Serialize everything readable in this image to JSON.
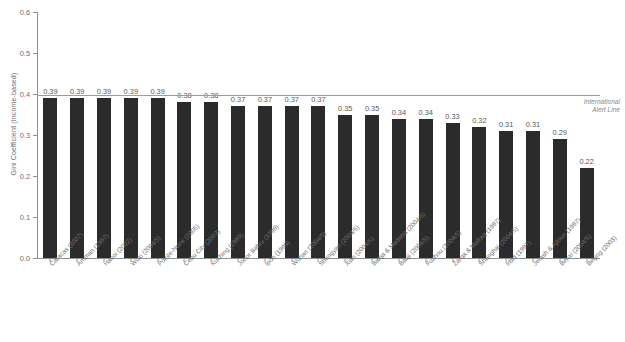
{
  "chart_data": {
    "type": "bar",
    "title": "",
    "subtitle": "",
    "xlabel": "",
    "ylabel": "Gini Coefficient (Income-based)",
    "ylim": [
      0.0,
      0.6
    ],
    "yticks": [
      "0.0",
      "0.1",
      "0.2",
      "0.3",
      "0.4",
      "0.5",
      "0.6"
    ],
    "ytick_values": [
      0.0,
      0.1,
      0.2,
      0.3,
      0.4,
      0.5,
      0.6
    ],
    "grid": false,
    "legend": "none",
    "orientation": "vertical",
    "bar_color": "#2b2b2b",
    "categories": [
      "Caracas (2007)",
      "Amman (1997)",
      "Hanoi (2002)",
      "Wuxi (2004/5)",
      "Pointe-Noire (2005)",
      "Cebu City (2003)",
      "Kuching (1999)",
      "Johor Bahru (1999)",
      "Ipoh (1999)",
      "Wuhan (2004/5)",
      "Shengyan (2004/5)",
      "Xian (2004/5)",
      "Balqa & Madaba (2004/5)",
      "Baoji (2004/5)",
      "Fuzhou (2004/5)",
      "Zarqa & Mafraq (1997)",
      "Shanghai (2004/5)",
      "Irbid (1997)",
      "Jerash & Ajloun (1997)",
      "Benxi (2004/5)",
      "Beijing (2003)"
    ],
    "values": [
      0.39,
      0.39,
      0.39,
      0.39,
      0.39,
      0.38,
      0.38,
      0.37,
      0.37,
      0.37,
      0.37,
      0.35,
      0.35,
      0.34,
      0.34,
      0.33,
      0.32,
      0.31,
      0.31,
      0.29,
      0.22
    ],
    "value_labels": [
      "0.39",
      "0.39",
      "0.39",
      "0.39",
      "0.39",
      "0.38",
      "0.38",
      "0.37",
      "0.37",
      "0.37",
      "0.37",
      "0.35",
      "0.35",
      "0.34",
      "0.34",
      "0.33",
      "0.32",
      "0.31",
      "0.31",
      "0.29",
      "0.22"
    ],
    "annotations": [
      {
        "name": "international-alert-line",
        "label": "International\nAlert Line",
        "label_line1": "International",
        "label_line2": "Alert Line",
        "y_value": 0.4,
        "color": "#9a9b9d"
      }
    ]
  },
  "axis": {
    "y_title": "Gini Coefficient (Income-based)",
    "axis_color": "#8e8f91"
  },
  "footer": {
    "source": ""
  }
}
